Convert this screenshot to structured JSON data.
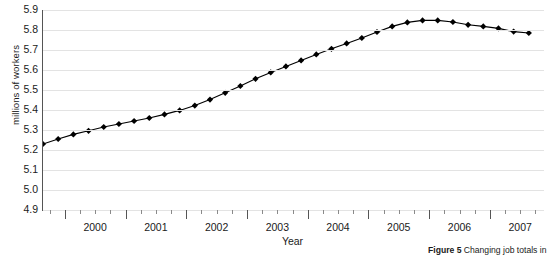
{
  "chart_data": {
    "type": "line",
    "title": "",
    "xlabel": "Year",
    "ylabel": "millions of workers",
    "ylim": [
      4.9,
      5.9
    ],
    "xlim": [
      1999.625,
      2007.875
    ],
    "grid": true,
    "legend": null,
    "marker": "diamond",
    "series_color": "#000000",
    "ytick_labels": [
      "5.9",
      "5.8",
      "5.7",
      "5.6",
      "5.5",
      "5.4",
      "5.3",
      "5.2",
      "5.1",
      "5.0",
      "4.9"
    ],
    "ytick_values": [
      5.9,
      5.8,
      5.7,
      5.6,
      5.5,
      5.4,
      5.3,
      5.2,
      5.1,
      5.0,
      4.9
    ],
    "xtick_labels": [
      "2000",
      "2001",
      "2002",
      "2003",
      "2004",
      "2005",
      "2006",
      "2007"
    ],
    "xtick_values": [
      2000,
      2001,
      2002,
      2003,
      2004,
      2005,
      2006,
      2007
    ],
    "x": [
      1999.625,
      1999.875,
      2000.125,
      2000.375,
      2000.625,
      2000.875,
      2001.125,
      2001.375,
      2001.625,
      2001.875,
      2002.125,
      2002.375,
      2002.625,
      2002.875,
      2003.125,
      2003.375,
      2003.625,
      2003.875,
      2004.125,
      2004.375,
      2004.625,
      2004.875,
      2005.125,
      2005.375,
      2005.625,
      2005.875,
      2006.125,
      2006.375,
      2006.625,
      2006.875,
      2007.125,
      2007.375,
      2007.625
    ],
    "values": [
      5.23,
      5.255,
      5.278,
      5.296,
      5.315,
      5.33,
      5.345,
      5.36,
      5.378,
      5.398,
      5.422,
      5.452,
      5.486,
      5.52,
      5.556,
      5.588,
      5.618,
      5.648,
      5.678,
      5.706,
      5.733,
      5.76,
      5.79,
      5.818,
      5.838,
      5.848,
      5.848,
      5.84,
      5.826,
      5.818,
      5.808,
      5.792,
      5.785
    ]
  },
  "axes": {
    "ylabel": "millions of workers",
    "xlabel": "Year"
  },
  "caption": {
    "figure_label": "Figure 5",
    "text": " Changing job totals in"
  }
}
